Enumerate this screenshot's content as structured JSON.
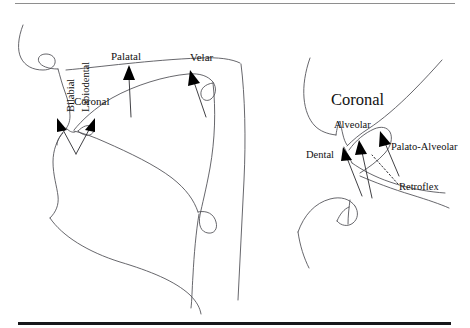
{
  "figure": {
    "type": "sagittal-vocal-tract-diagram",
    "title_visible": false,
    "panels": [
      {
        "id": "left-panel",
        "name": "full-vocal-tract",
        "labels": [
          {
            "id": "bilabial",
            "text": "Bilabial",
            "orientation": "vertical",
            "x": 66,
            "y": 112,
            "size": 10.5
          },
          {
            "id": "labiodental",
            "text": "Labiodental",
            "orientation": "vertical",
            "x": 80,
            "y": 112,
            "size": 10.5
          },
          {
            "id": "coronal-left",
            "text": "Coronal",
            "orientation": "horizontal",
            "x": 74,
            "y": 101,
            "size": 11
          },
          {
            "id": "palatal",
            "text": "Palatal",
            "orientation": "horizontal",
            "x": 111,
            "y": 56,
            "size": 11
          },
          {
            "id": "velar",
            "text": "Velar",
            "orientation": "horizontal",
            "x": 190,
            "y": 57,
            "size": 11
          }
        ],
        "arrows": [
          {
            "id": "arrow-bilabial",
            "points": "lips-upper-left"
          },
          {
            "id": "arrow-labiodental",
            "points": "lips-upper-right"
          },
          {
            "id": "arrow-palatal",
            "points": "hard-palate"
          },
          {
            "id": "arrow-velar",
            "points": "soft-palate-velum"
          }
        ]
      },
      {
        "id": "right-panel",
        "name": "coronal-detail",
        "heading": "Coronal",
        "labels": [
          {
            "id": "coronal-heading",
            "text": "Coronal",
            "orientation": "horizontal",
            "x": 330,
            "y": 104,
            "size": 16.5
          },
          {
            "id": "alveolar",
            "text": "Alveolar",
            "orientation": "horizontal",
            "x": 332,
            "y": 127,
            "size": 10.5
          },
          {
            "id": "dental",
            "text": "Dental",
            "orientation": "horizontal",
            "x": 308,
            "y": 156,
            "size": 10.5
          },
          {
            "id": "palato-alveolar",
            "text": "Palato-Alveolar",
            "orientation": "horizontal",
            "x": 391,
            "y": 148,
            "size": 10.5
          },
          {
            "id": "retroflex",
            "text": "Retroflex",
            "orientation": "horizontal",
            "x": 400,
            "y": 188,
            "size": 10.5
          }
        ],
        "arrows": [
          {
            "id": "arrow-dental",
            "style": "solid"
          },
          {
            "id": "arrow-alveolar",
            "style": "solid"
          },
          {
            "id": "arrow-palato-alveolar",
            "style": "solid"
          },
          {
            "id": "arrow-retroflex",
            "style": "dotted"
          }
        ]
      }
    ],
    "rules": [
      {
        "id": "rule-top",
        "weight": "thin",
        "color": "#8e8e8e"
      },
      {
        "id": "rule-bottom",
        "weight": "thick",
        "color": "#17171a"
      }
    ],
    "colors": {
      "background": "#ffffff",
      "outline": "#4c4c52",
      "ink": "#111111",
      "arrow": "#000000"
    }
  }
}
